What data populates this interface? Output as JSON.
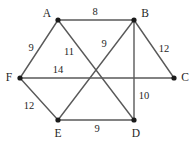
{
  "figure": {
    "kind": "weighted-undirected-graph",
    "width": 195,
    "height": 146,
    "background_color": "#ffffff",
    "edge_color": "#595959",
    "vertex_color": "#1a1a1a",
    "label_color": "#262626"
  },
  "vertices": [
    {
      "id": "A",
      "label": "A",
      "x": 58,
      "y": 20,
      "label_x": 47,
      "label_y": 14
    },
    {
      "id": "B",
      "label": "B",
      "x": 134,
      "y": 20,
      "label_x": 145,
      "label_y": 14
    },
    {
      "id": "C",
      "label": "C",
      "x": 174,
      "y": 78,
      "label_x": 185,
      "label_y": 78
    },
    {
      "id": "D",
      "label": "D",
      "x": 134,
      "y": 120,
      "label_x": 136,
      "label_y": 134
    },
    {
      "id": "E",
      "label": "E",
      "x": 58,
      "y": 120,
      "label_x": 58,
      "label_y": 134
    },
    {
      "id": "F",
      "label": "F",
      "x": 20,
      "y": 78,
      "label_x": 9,
      "label_y": 78
    }
  ],
  "edges": [
    {
      "from": "A",
      "to": "B",
      "weight": "8",
      "label_x": 95,
      "label_y": 12
    },
    {
      "from": "A",
      "to": "F",
      "weight": "9",
      "label_x": 31,
      "label_y": 48
    },
    {
      "from": "A",
      "to": "D",
      "weight": "11",
      "label_x": 69,
      "label_y": 52
    },
    {
      "from": "B",
      "to": "E",
      "weight": "9",
      "label_x": 104,
      "label_y": 44
    },
    {
      "from": "B",
      "to": "C",
      "weight": "12",
      "label_x": 164,
      "label_y": 49
    },
    {
      "from": "B",
      "to": "D",
      "weight": "10",
      "label_x": 144,
      "label_y": 96
    },
    {
      "from": "F",
      "to": "C",
      "weight": "14",
      "label_x": 58,
      "label_y": 70
    },
    {
      "from": "F",
      "to": "E",
      "weight": "12",
      "label_x": 29,
      "label_y": 106
    },
    {
      "from": "E",
      "to": "D",
      "weight": "9",
      "label_x": 97,
      "label_y": 129
    }
  ]
}
